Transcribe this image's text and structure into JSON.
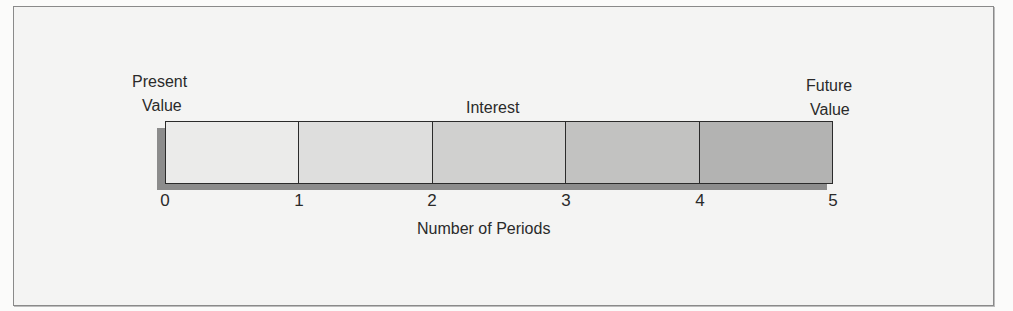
{
  "diagram": {
    "labels": {
      "present_value_line1": "Present",
      "present_value_line2": "Value",
      "interest": "Interest",
      "future_value_line1": "Future",
      "future_value_line2": "Value",
      "x_axis": "Number of Periods"
    },
    "periods": [
      "0",
      "1",
      "2",
      "3",
      "4",
      "5"
    ],
    "segment_colors": [
      "#ebebea",
      "#dededd",
      "#d0d0cf",
      "#c2c2c1",
      "#b3b3b2"
    ],
    "shadow_color": "#8c8c8c",
    "border_color": "#2b2b2b"
  }
}
